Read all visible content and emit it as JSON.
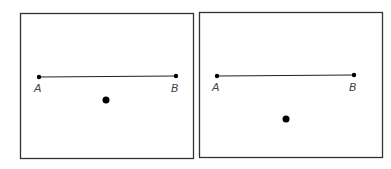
{
  "panels": [
    {
      "id": "left",
      "box": {
        "x": 20,
        "y": 13,
        "w": 173,
        "h": 145
      },
      "segment": {
        "x1": 39,
        "y1": 77,
        "x2": 176,
        "y2": 76
      },
      "point_a_label": "A",
      "point_b_label": "B",
      "dot": {
        "cx": 106,
        "cy": 100,
        "r": 3.5
      }
    },
    {
      "id": "right",
      "box": {
        "x": 199,
        "y": 12,
        "w": 183,
        "h": 145
      },
      "segment": {
        "x1": 217,
        "y1": 76,
        "x2": 354,
        "y2": 75
      },
      "point_a_label": "A",
      "point_b_label": "B",
      "dot": {
        "cx": 286,
        "cy": 119,
        "r": 3.5
      }
    }
  ],
  "colors": {
    "stroke": "#333333",
    "fill": "#000000",
    "label": "#444444"
  }
}
